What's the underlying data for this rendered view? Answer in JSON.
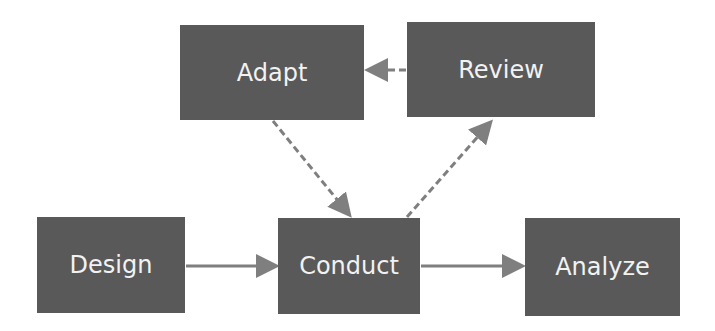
{
  "diagram": {
    "nodes": [
      {
        "id": "adapt",
        "label": "Adapt"
      },
      {
        "id": "review",
        "label": "Review"
      },
      {
        "id": "design",
        "label": "Design"
      },
      {
        "id": "conduct",
        "label": "Conduct"
      },
      {
        "id": "analyze",
        "label": "Analyze"
      }
    ],
    "edges": [
      {
        "from": "design",
        "to": "conduct",
        "style": "solid"
      },
      {
        "from": "conduct",
        "to": "analyze",
        "style": "solid"
      },
      {
        "from": "conduct",
        "to": "review",
        "style": "dashed"
      },
      {
        "from": "review",
        "to": "adapt",
        "style": "dashed"
      },
      {
        "from": "adapt",
        "to": "conduct",
        "style": "dashed"
      }
    ],
    "colors": {
      "box": "#595959",
      "text": "#f2f2f2",
      "arrow": "#7f7f7f"
    }
  }
}
